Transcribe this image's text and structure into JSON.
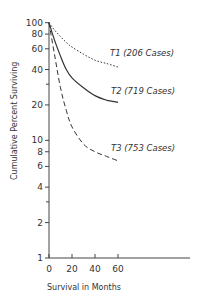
{
  "chart_data": {
    "type": "line",
    "title": "",
    "xlabel": "Survival in Months",
    "ylabel": "Cumulative Percent Surviving",
    "xlim": [
      0,
      60
    ],
    "ylim": [
      1,
      100
    ],
    "yscale": "log",
    "grid": false,
    "legend": "inline labels at line ends",
    "x_ticks": [
      0,
      20,
      40,
      60
    ],
    "y_ticks": [
      1,
      2,
      4,
      6,
      8,
      10,
      20,
      40,
      60,
      80,
      100
    ],
    "y_tick_labels": [
      "1",
      "2",
      "4",
      "6",
      "8",
      "10",
      "20",
      "40",
      "60",
      "80",
      "100"
    ],
    "series": [
      {
        "name": "T1 (206 Cases)",
        "style": "dotted",
        "x": [
          0,
          5,
          10,
          15,
          20,
          30,
          40,
          50,
          60
        ],
        "y": [
          100,
          86,
          76,
          68,
          62,
          54,
          48,
          45,
          42
        ]
      },
      {
        "name": "T2 (719 Cases)",
        "style": "solid",
        "x": [
          0,
          5,
          10,
          15,
          20,
          30,
          40,
          50,
          60
        ],
        "y": [
          100,
          70,
          52,
          40,
          34,
          28,
          24,
          22,
          21
        ]
      },
      {
        "name": "T3 (753 Cases)",
        "style": "dashed",
        "x": [
          0,
          5,
          10,
          15,
          20,
          30,
          40,
          50,
          60
        ],
        "y": [
          100,
          52,
          28,
          18,
          13,
          9.3,
          8,
          7.3,
          6.7
        ]
      }
    ]
  },
  "labels": {
    "xlabel": "Survival in Months",
    "ylabel": "Cumulative Percent Surviving",
    "series": [
      "T1 (206 Cases)",
      "T2 (719 Cases)",
      "T3 (753 Cases)"
    ]
  }
}
